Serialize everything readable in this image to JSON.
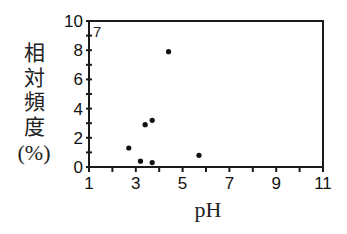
{
  "chart_data": {
    "type": "scatter",
    "title": "",
    "panel_label": "7",
    "xlabel": "pH",
    "ylabel": "相対頻度(%)",
    "ylabel_chars": [
      "相",
      "対",
      "頻",
      "度",
      "(%)"
    ],
    "xlim": [
      1,
      11
    ],
    "ylim": [
      0,
      10
    ],
    "x_ticks": [
      1,
      3,
      5,
      7,
      9,
      11
    ],
    "x_minor_ticks": [
      1,
      2,
      3,
      4,
      5,
      6,
      7,
      8,
      9,
      10,
      11
    ],
    "y_ticks": [
      0,
      2,
      4,
      6,
      8,
      10
    ],
    "y_minor_ticks": [
      0,
      1,
      2,
      3,
      4,
      5,
      6,
      7,
      8,
      9,
      10
    ],
    "grid": false,
    "legend": null,
    "series": [
      {
        "name": "data",
        "marker": "circle",
        "color": "#111111",
        "points": [
          {
            "x": 2.7,
            "y": 1.3
          },
          {
            "x": 3.2,
            "y": 0.4
          },
          {
            "x": 3.4,
            "y": 2.9
          },
          {
            "x": 3.7,
            "y": 3.2
          },
          {
            "x": 3.7,
            "y": 0.3
          },
          {
            "x": 4.4,
            "y": 7.9
          },
          {
            "x": 5.7,
            "y": 0.8
          }
        ]
      }
    ]
  },
  "colors": {
    "axis": "#1a1a1a",
    "marker": "#111111",
    "background": "#ffffff"
  }
}
